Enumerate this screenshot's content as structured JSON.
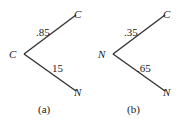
{
  "diagrams": [
    {
      "id": "a",
      "caption": "(a)",
      "root": "C",
      "branches": [
        {
          "prob": ".85",
          "to": "C"
        },
        {
          "prob": "15",
          "to": "N"
        }
      ]
    },
    {
      "id": "b",
      "caption": "(b)",
      "root": "N",
      "branches": [
        {
          "prob": ".35",
          "to": "C"
        },
        {
          "prob": ".65",
          "to": "N"
        }
      ]
    }
  ]
}
